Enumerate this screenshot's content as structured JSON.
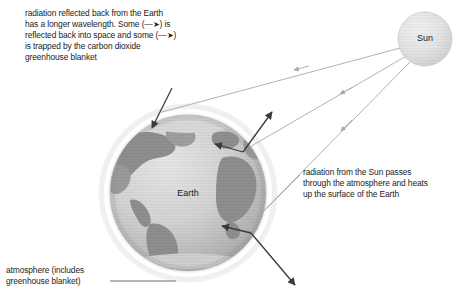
{
  "diagram": {
    "background_color": "#ffffff",
    "width": 470,
    "height": 305
  },
  "bodies": {
    "sun": {
      "label": "Sun",
      "cx": 425,
      "cy": 39,
      "r": 27,
      "fill": "#e2e2e2",
      "stroke": "#cfcfcf"
    },
    "earth": {
      "label": "Earth",
      "cx": 188,
      "cy": 193,
      "r": 78,
      "ocean_fill": "#cfcfcf",
      "land_fill": "#8e8e8e",
      "atmosphere_fill": "#f2f2f2",
      "atmosphere_r": 90
    }
  },
  "notes": {
    "reflected": {
      "name": "reflected-radiation-note",
      "lines": [
        "radiation reflected back from the Earth",
        "has a longer wavelength. Some (—➤) is",
        "reflected back into space and some (—➤)",
        "is trapped by the carbon dioxide",
        "greenhouse blanket"
      ]
    },
    "incoming": {
      "name": "incoming-radiation-note",
      "lines": [
        "radiation from the Sun passes",
        "through the atmosphere and heats",
        "up the surface of the Earth"
      ]
    },
    "atmosphere": {
      "name": "atmosphere-caption",
      "lines": [
        "atmosphere (includes",
        "greenhouse blanket)"
      ]
    }
  },
  "arrows": {
    "incoming_rays": {
      "color": "#a9a9a9",
      "description": "radiation from the Sun passing through the atmosphere",
      "count": 3
    },
    "reflected_rays": {
      "color": "#3a3a3a",
      "description": "longer wavelength radiation reflected back from the Earth",
      "count": 4
    }
  },
  "leader_line": {
    "name": "atmosphere-leader-line",
    "color": "#6f6f6f",
    "x1": 110,
    "y1": 281,
    "x2": 176,
    "y2": 281
  }
}
